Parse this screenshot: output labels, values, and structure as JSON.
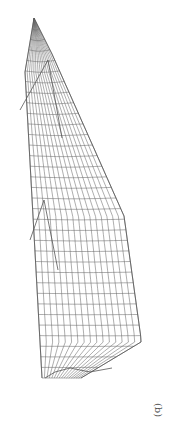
{
  "figure": {
    "label": "(b)",
    "orientation_deg": 90,
    "line_color": "#6a6a6a",
    "background": "#ffffff"
  }
}
